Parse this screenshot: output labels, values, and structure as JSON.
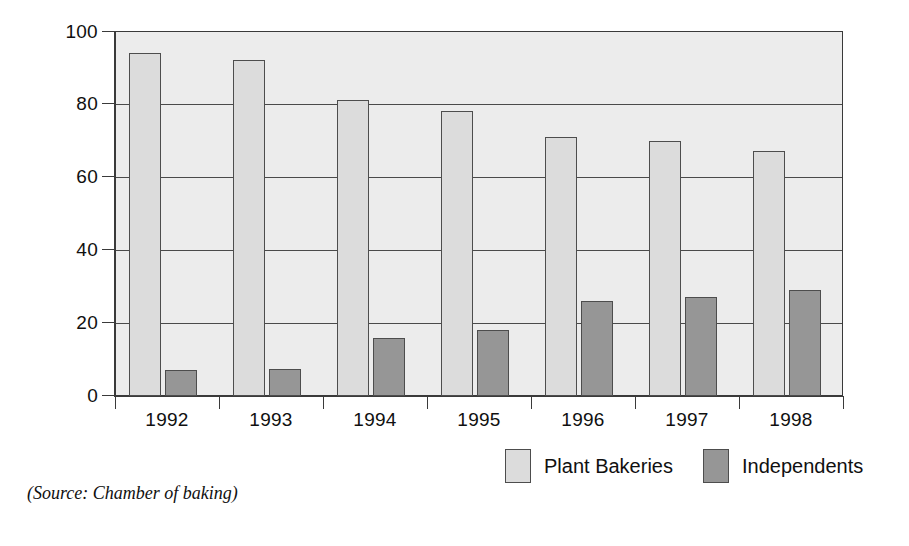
{
  "chart_data": {
    "type": "bar",
    "title": "",
    "subtitle": "",
    "xlabel": "",
    "ylabel": "",
    "categories": [
      "1992",
      "1993",
      "1994",
      "1995",
      "1996",
      "1997",
      "1998"
    ],
    "series": [
      {
        "name": "Plant Bakeries",
        "color": "#dcdcdc",
        "values": [
          94,
          92,
          81,
          78,
          71,
          70,
          67
        ]
      },
      {
        "name": "Independents",
        "color": "#969696",
        "values": [
          7,
          7.5,
          16,
          18,
          26,
          27,
          29
        ]
      }
    ],
    "ylim": [
      0,
      100
    ],
    "ytick_values": [
      0,
      20,
      40,
      60,
      80,
      100
    ],
    "ytick_labels": [
      "0",
      "20",
      "40",
      "60",
      "80",
      "100"
    ],
    "gridlines": [
      20,
      40,
      60,
      80,
      100
    ],
    "grid": true,
    "legend_position": "bottom-right",
    "annotations": [
      "(Source: Chamber of baking)"
    ]
  },
  "legend": {
    "items": [
      {
        "label": "Plant Bakeries",
        "swatch": "plant"
      },
      {
        "label": "Independents",
        "swatch": "indep"
      }
    ]
  },
  "source": {
    "text": "(Source: Chamber of baking)"
  },
  "colors": {
    "plot_background": "#ececec",
    "plant_bar": "#dcdcdc",
    "independents_bar": "#969696",
    "axis": "#3a3a3a",
    "gridline": "#4a4a4a",
    "text": "#101010",
    "page_background": "#ffffff"
  }
}
